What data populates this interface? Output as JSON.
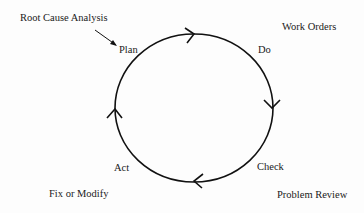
{
  "diagram": {
    "type": "PDCA cycle",
    "stages": [
      {
        "label": "Plan"
      },
      {
        "label": "Do"
      },
      {
        "label": "Check"
      },
      {
        "label": "Act"
      }
    ],
    "annotations": {
      "plan": "Root Cause Analysis",
      "do": "Work Orders",
      "check": "Problem Review",
      "act": "Fix or Modify"
    },
    "colors": {
      "stroke": "#111111",
      "text": "#1a1a1a",
      "background": "#fdfdfd"
    },
    "flow_direction": "clockwise"
  }
}
